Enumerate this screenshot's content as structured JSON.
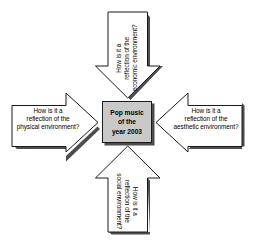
{
  "diagram": {
    "type": "four-arrows-converging",
    "background_color": "#ffffff",
    "center": {
      "lines": [
        "Pop music",
        "of the",
        "year 2003"
      ],
      "fill_color": "#c9c9c9",
      "border_color": "#1a1a1a",
      "shadow_color": "#4d4d4d"
    },
    "arrows": [
      {
        "position": "top",
        "direction": "down",
        "text_rotation": "-90",
        "lines": [
          "How is it a",
          "reflection of the",
          "economic environment?"
        ]
      },
      {
        "position": "right",
        "direction": "left",
        "text_rotation": "0",
        "lines": [
          "How is it a",
          "reflection of the",
          "aesthetic environment?"
        ]
      },
      {
        "position": "bottom",
        "direction": "up",
        "text_rotation": "90",
        "lines": [
          "How is it a",
          "reflection of the",
          "social environment?"
        ]
      },
      {
        "position": "left",
        "direction": "right",
        "text_rotation": "0",
        "lines": [
          "How is it a",
          "reflection of the",
          "physical environment?"
        ]
      }
    ]
  }
}
